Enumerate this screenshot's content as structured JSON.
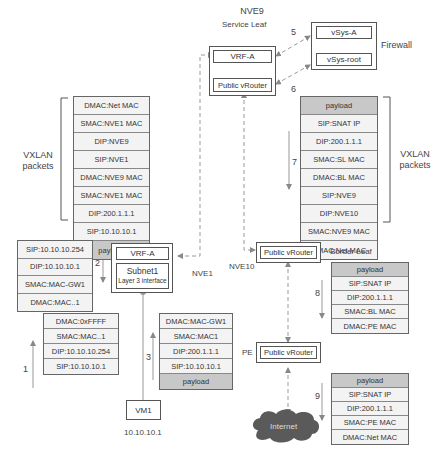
{
  "nodes": {
    "nve9": {
      "title": "NVE9",
      "subtitle": "Service Leaf",
      "vrf": "VRF-A",
      "vrouter": "Public vRouter"
    },
    "firewall": {
      "label": "Firewall",
      "vsys_a": "vSys-A",
      "vsys_root": "vSys-root"
    },
    "nve1": {
      "label": "NVE1",
      "vrf": "VRF-A",
      "subnet": "Subnet1",
      "subnet_sub": "Layer 3 interface"
    },
    "nve10": {
      "label": "NVE10",
      "vrouter": "Public vRouter",
      "role": "Border Leaf"
    },
    "pe": {
      "label": "PE",
      "vrouter": "Public vRouter"
    },
    "vm1": {
      "label": "VM1",
      "ip": "10.10.10.1"
    },
    "internet": {
      "label": "Internet"
    }
  },
  "brackets": {
    "left": "VXLAN\npackets",
    "right": "VXLAN\npackets"
  },
  "steps": {
    "s1": "1",
    "s2": "2",
    "s3": "3",
    "s4": "4",
    "s5": "5",
    "s6": "6",
    "s7": "7",
    "s8": "8",
    "s9": "9"
  },
  "packets": {
    "step1": [
      "DMAC:0xFFFF",
      "SMAC:MAC..1",
      "DIP:10.10.10.254",
      "SIP:10.10.10.1"
    ],
    "step2": [
      "SIP:10.10.10.254",
      "DIP:10.10.10.1",
      "SMAC:MAC-GW1",
      "DMAC:MAC..1"
    ],
    "step3": [
      "DMAC:MAC-GW1",
      "SMAC:MAC1",
      "DIP:200.1.1.1",
      "SIP:10.10.10.1",
      "payload"
    ],
    "step4": [
      "DMAC:Net MAC",
      "SMAC:NVE1 MAC",
      "DIP:NVE9",
      "SIP:NVE1",
      "DMAC:NVE9 MAC",
      "SMAC:NVE1 MAC",
      "DIP:200.1.1.1",
      "SIP:10.10.10.1",
      "payload"
    ],
    "step7": [
      "payload",
      "SIP:SNAT IP",
      "DIP:200.1.1.1",
      "SMAC:SL MAC",
      "DMAC:BL MAC",
      "SIP:NVE9",
      "DIP:NVE10",
      "SMAC:NVE9 MAC",
      "DMAC:Net MAC"
    ],
    "step8": [
      "payload",
      "SIP:SNAT IP",
      "DIP:200.1.1.1",
      "SMAC:BL MAC",
      "DMAC:PE MAC"
    ],
    "step9": [
      "payload",
      "SIP:SNAT IP",
      "DIP:200.1.1.1",
      "SMAC:PE MAC",
      "DMAC:Net MAC"
    ]
  },
  "colors": {
    "payload_fill": "#c8c8c8",
    "cell_fill": "#f3f3f3",
    "link": "#999999",
    "cloud": "#5a5a5a"
  }
}
